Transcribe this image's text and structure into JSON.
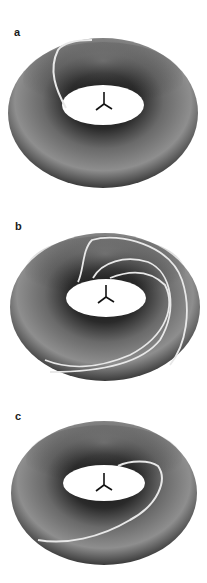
{
  "figure": {
    "panels": [
      {
        "label": "a",
        "curve_count": 1
      },
      {
        "label": "b",
        "curve_count": 3
      },
      {
        "label": "c",
        "curve_count": 1
      }
    ]
  },
  "colors": {
    "background": "#ffffff",
    "torus_dark": "#1e1e1e",
    "torus_mid": "#6e6e6e",
    "torus_light": "#9a9a9a",
    "curve": "#e8e8e8",
    "axes_glyph": "#111111"
  }
}
